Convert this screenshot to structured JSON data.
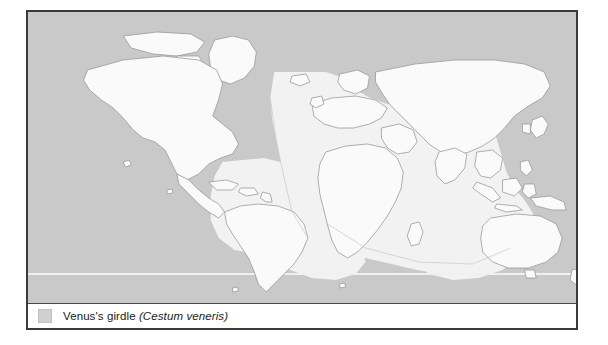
{
  "figure": {
    "type": "distribution-map",
    "projection": "equirectangular-world",
    "legend": {
      "swatch_icon": "shaded-area-swatch",
      "common_name": "Venus's girdle",
      "scientific_name": "(Cestum veneris)",
      "swatch_color": "#d0d0d0"
    },
    "colors": {
      "distribution_shading": "#c9c9c9",
      "outside_range_ocean": "#f2f2f2",
      "land_fill": "#fafafa",
      "coastline_stroke": "#9a9a9a",
      "frame_border": "#3b3b3b",
      "latitude_line": "#f0f0f0",
      "page_background": "#ffffff"
    },
    "map_data": {
      "shaded_regions": [
        "North Pacific Ocean",
        "South Pacific Ocean (southern band)",
        "North Atlantic Ocean",
        "South Atlantic Ocean (southern band)",
        "Mediterranean Sea",
        "Black Sea",
        "Northwest Pacific off Japan",
        "Tasman Sea and Southern Ocean",
        "Arctic fringe North Atlantic"
      ],
      "unshaded_regions": [
        "Tropical Atlantic off Africa and South America",
        "Indian Ocean",
        "Central and South America landmass",
        "Africa landmass",
        "Australia landmass",
        "Indonesian archipelago",
        "Arabian Sea and Bay of Bengal"
      ],
      "latitude_reference_line_visible": true
    }
  }
}
